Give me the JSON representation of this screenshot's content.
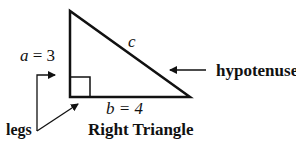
{
  "diagram": {
    "title": "Right Triangle",
    "labels": {
      "side_a": "a = 3",
      "side_a_var": "a",
      "side_a_val": "= 3",
      "side_b": "b = 4",
      "hypotenuse_var": "c",
      "hypotenuse_label": "hypotenuse",
      "legs_label": "legs"
    },
    "triangle": {
      "vertices": [
        [
          70,
          11
        ],
        [
          70,
          97
        ],
        [
          190,
          97
        ]
      ],
      "right_angle_marker": true
    },
    "colors": {
      "stroke": "#111111",
      "background": "#ffffff"
    }
  }
}
